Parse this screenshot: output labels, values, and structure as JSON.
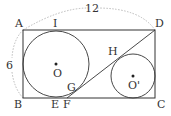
{
  "diagram": {
    "colors": {
      "line": "#333333",
      "dashed": "#999999",
      "background": "#ffffff"
    },
    "labels": {
      "A": "A",
      "B": "B",
      "C": "C",
      "D": "D",
      "E": "E",
      "F": "F",
      "G": "G",
      "H": "H",
      "I": "I",
      "O": "O",
      "O2": "O'"
    },
    "dimensions": {
      "top": "12",
      "left": "6"
    }
  }
}
